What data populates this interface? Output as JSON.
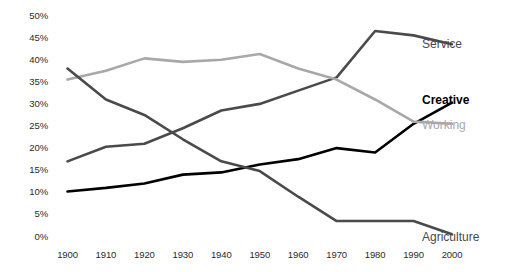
{
  "chart_data": {
    "type": "line",
    "title": "",
    "subtitle": "",
    "xlabel": "",
    "ylabel": "",
    "x": [
      1900,
      1910,
      1920,
      1930,
      1940,
      1950,
      1960,
      1970,
      1980,
      1990,
      2000
    ],
    "categories": [
      "1900",
      "1910",
      "1920",
      "1930",
      "1940",
      "1950",
      "1960",
      "1970",
      "1980",
      "1990",
      "2000"
    ],
    "xlim": [
      1900,
      2000
    ],
    "ylim": [
      0,
      50
    ],
    "y_ticks": [
      0,
      5,
      10,
      15,
      20,
      25,
      30,
      35,
      40,
      45,
      50
    ],
    "y_tick_labels": [
      "0%",
      "5%",
      "10%",
      "15%",
      "20%",
      "25%",
      "30%",
      "35%",
      "40%",
      "45%",
      "50%"
    ],
    "grid": false,
    "legend_position": "right-inline",
    "series": [
      {
        "name": "Service",
        "color": "#4a4a4a",
        "bold_label": false,
        "values": [
          17.0,
          20.3,
          21.0,
          24.5,
          28.5,
          30.0,
          33.0,
          36.0,
          46.5,
          45.5,
          43.5
        ]
      },
      {
        "name": "Creative",
        "color": "#000000",
        "bold_label": true,
        "values": [
          10.2,
          11.0,
          12.0,
          14.0,
          14.5,
          16.3,
          17.5,
          20.0,
          19.0,
          25.5,
          30.3
        ]
      },
      {
        "name": "Working",
        "color": "#a8a8a8",
        "bold_label": false,
        "values": [
          35.5,
          37.5,
          40.3,
          39.5,
          40.0,
          41.3,
          38.0,
          35.5,
          31.0,
          26.0,
          25.5
        ]
      },
      {
        "name": "Agriculture",
        "color": "#4a4a4a",
        "bold_label": false,
        "values": [
          38.0,
          31.0,
          27.5,
          22.0,
          17.0,
          14.8,
          9.0,
          3.5,
          3.5,
          3.5,
          0.5
        ]
      }
    ]
  },
  "labels": {
    "service": "Service",
    "creative": "Creative",
    "working": "Working",
    "agriculture": "Agriculture"
  }
}
